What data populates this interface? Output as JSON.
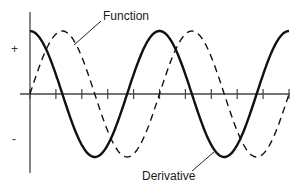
{
  "chart_data": {
    "type": "line",
    "title": "",
    "xlabel": "",
    "ylabel": "",
    "y_tick_labels": [
      "+",
      "-"
    ],
    "x_ticks_count": 11,
    "annotations": [
      "Function",
      "Derivative"
    ],
    "series": [
      {
        "name": "Function",
        "style": "dashed",
        "shape": "sin(x)",
        "periods": 2.0
      },
      {
        "name": "Derivative",
        "style": "solid",
        "shape": "cos(x)",
        "periods": 2.0
      }
    ],
    "x_range_periods": [
      0,
      2
    ],
    "ylim": [
      -1,
      1
    ],
    "grid": false,
    "legend": "none (leader-line labels)"
  },
  "labels": {
    "function": "Function",
    "derivative": "Derivative",
    "plus": "+",
    "minus": "-"
  },
  "geometry": {
    "x0": 30,
    "x1": 289,
    "axis_y": 94,
    "amplitude": 63,
    "period": 129.5,
    "tick_spacing": 25.9,
    "vaxis_top": 12,
    "vaxis_bottom": 173
  },
  "colors": {
    "curve": "#111111",
    "axis": "#444444",
    "text": "#1a1a1a"
  }
}
